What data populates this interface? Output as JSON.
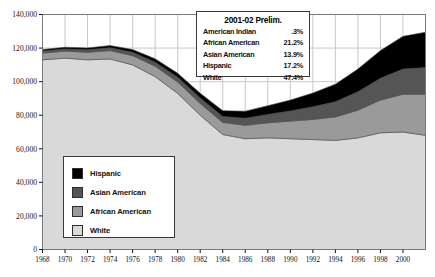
{
  "chart_data": {
    "type": "area",
    "stacked": true,
    "title": "",
    "xlabel": "",
    "ylabel": "",
    "x": [
      1968,
      1970,
      1972,
      1974,
      1976,
      1978,
      1980,
      1982,
      1984,
      1986,
      1988,
      1990,
      1992,
      1994,
      1996,
      1998,
      2000,
      2002
    ],
    "tick_years": [
      1968,
      1970,
      1972,
      1974,
      1976,
      1978,
      1980,
      1982,
      1984,
      1986,
      1988,
      1990,
      1992,
      1994,
      1996,
      1998,
      2000
    ],
    "xlim": [
      1968,
      2002
    ],
    "ylim": [
      0,
      140000
    ],
    "yticks": [
      0,
      20000,
      40000,
      60000,
      80000,
      100000,
      120000,
      140000
    ],
    "ytick_labels": [
      "0",
      "20,000",
      "40,000",
      "60,000",
      "80,000",
      "100,000",
      "120,000",
      "140,000"
    ],
    "grid": true,
    "grid_axis": "both",
    "series": [
      {
        "name": "White",
        "color": "#d9d9d9",
        "values": [
          113000,
          114000,
          113000,
          113500,
          110000,
          103000,
          93000,
          80000,
          68500,
          66000,
          66500,
          66000,
          65500,
          65000,
          66500,
          69500,
          70000,
          68000
        ]
      },
      {
        "name": "African American",
        "color": "#9a9a9a",
        "values": [
          4000,
          4200,
          4500,
          5000,
          5500,
          6200,
          6800,
          7000,
          7200,
          8000,
          9000,
          10500,
          12000,
          14000,
          16500,
          19500,
          22500,
          24500
        ]
      },
      {
        "name": "Asian American",
        "color": "#555555",
        "values": [
          1200,
          1300,
          1500,
          1700,
          2000,
          2400,
          2800,
          3200,
          3600,
          4200,
          5000,
          6000,
          7500,
          9000,
          11000,
          13000,
          15000,
          16000
        ]
      },
      {
        "name": "Hispanic",
        "color": "#000000",
        "values": [
          900,
          1000,
          1100,
          1300,
          1600,
          2000,
          2400,
          2900,
          3400,
          4200,
          5200,
          6500,
          8200,
          10500,
          13500,
          16500,
          19500,
          21000
        ]
      }
    ],
    "annotation_order_note": "bands stacked bottom-to-top: White, African American, Asian American, Hispanic"
  },
  "legend": {
    "position": "lower-left-inside",
    "items": [
      {
        "label": "Hispanic",
        "color": "#000000"
      },
      {
        "label": "Asian American",
        "color": "#555555"
      },
      {
        "label": "African American",
        "color": "#9a9a9a"
      },
      {
        "label": "White",
        "color": "#d9d9d9"
      }
    ]
  },
  "info_box": {
    "title": "2001-02 Prelim.",
    "rows": [
      {
        "name": "American Indian",
        "value": ".3%"
      },
      {
        "name": "African American",
        "value": "21.2%"
      },
      {
        "name": "Asian American",
        "value": "13.9%"
      },
      {
        "name": "Hispanic",
        "value": "17.2%"
      },
      {
        "name": "White",
        "value": "47.4%"
      }
    ]
  },
  "colors": {
    "plot_border": "#7a7a7a",
    "grid": "#c9c9c9",
    "axis_text": "#111111",
    "background": "#ffffff"
  }
}
